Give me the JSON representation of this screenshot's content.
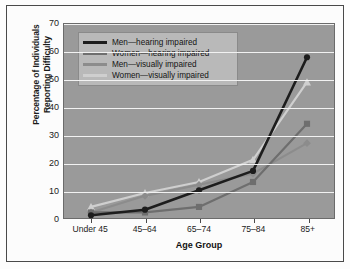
{
  "chart_data": {
    "type": "line",
    "title": "",
    "xlabel": "Age Group",
    "ylabel": "Percentage of Individuals Reporting Difficulty",
    "ylabel_line1": "Percentage of Individuals",
    "ylabel_line2": "Reporting Difficulty",
    "categories": [
      "Under 45",
      "45–64",
      "65–74",
      "75–84",
      "85+"
    ],
    "ylim": [
      0,
      70
    ],
    "yticks": [
      0,
      10,
      20,
      30,
      40,
      50,
      60,
      70
    ],
    "grid": true,
    "legend_position": "top-left",
    "series": [
      {
        "name": "Men—hearing impaired",
        "color": "#1d1d1d",
        "marker": "circle",
        "values": [
          1,
          3,
          10,
          17,
          58
        ]
      },
      {
        "name": "Women—hearing impaired",
        "color": "#6e6e6e",
        "marker": "square",
        "values": [
          2,
          2,
          4,
          13,
          34
        ]
      },
      {
        "name": "Men—visually impaired",
        "color": "#8c8c8c",
        "marker": "diamond",
        "values": [
          2,
          8,
          12,
          16,
          27
        ]
      },
      {
        "name": "Women—visually impaired",
        "color": "#cfcfcf",
        "marker": "triangle",
        "values": [
          4,
          9,
          13,
          21,
          49
        ]
      }
    ]
  },
  "colors": {
    "plot_background": "#9a9a9a",
    "gridline": "#f2f2f2",
    "page_background": "#fcfcfc",
    "frame_border": "#4a4a4a",
    "legend_background": "#b9b9b9",
    "axis_text": "#1b1b1b"
  }
}
